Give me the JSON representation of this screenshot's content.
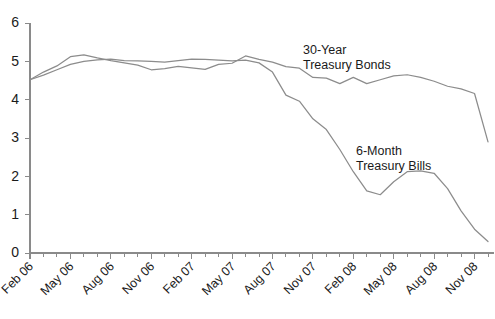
{
  "chart_data": {
    "type": "line",
    "title": "",
    "subtitle": "",
    "xlabel": "",
    "ylabel": "",
    "ylim": [
      0,
      6
    ],
    "y_ticks": [
      0,
      1,
      2,
      3,
      4,
      5,
      6
    ],
    "grid": false,
    "legend_position": "inline-annotation",
    "background_color": "#ffffff",
    "axis_color": "#8a8a8a",
    "x": [
      "Feb 06",
      "Mar 06",
      "Apr 06",
      "May 06",
      "Jun 06",
      "Jul 06",
      "Aug 06",
      "Sep 06",
      "Oct 06",
      "Nov 06",
      "Dec 06",
      "Jan 07",
      "Feb 07",
      "Mar 07",
      "Apr 07",
      "May 07",
      "Jun 07",
      "Jul 07",
      "Aug 07",
      "Sep 07",
      "Oct 07",
      "Nov 07",
      "Dec 07",
      "Jan 08",
      "Feb 08",
      "Mar 08",
      "Apr 08",
      "May 08",
      "Jun 08",
      "Jul 08",
      "Aug 08",
      "Sep 08",
      "Oct 08",
      "Nov 08",
      "Dec 08"
    ],
    "x_tick_labels": [
      {
        "index": 0,
        "label": "Feb 06"
      },
      {
        "index": 3,
        "label": "May 06"
      },
      {
        "index": 6,
        "label": "Aug 06"
      },
      {
        "index": 9,
        "label": "Nov 06"
      },
      {
        "index": 12,
        "label": "Feb 07"
      },
      {
        "index": 15,
        "label": "May 07"
      },
      {
        "index": 18,
        "label": "Aug 07"
      },
      {
        "index": 21,
        "label": "Nov 07"
      },
      {
        "index": 24,
        "label": "Feb 08"
      },
      {
        "index": 27,
        "label": "May 08"
      },
      {
        "index": 30,
        "label": "Aug 08"
      },
      {
        "index": 33,
        "label": "Nov 08"
      }
    ],
    "series": [
      {
        "name": "30-Year Treasury Bonds",
        "color": "#8c8c8c",
        "annotation_lines": [
          "30-Year",
          "Treasury Bonds"
        ],
        "values": [
          4.52,
          4.72,
          4.88,
          5.12,
          5.17,
          5.09,
          5.02,
          4.96,
          4.9,
          4.78,
          4.81,
          4.87,
          4.83,
          4.79,
          4.92,
          4.95,
          5.14,
          5.05,
          4.98,
          4.86,
          4.82,
          4.58,
          4.56,
          4.42,
          4.58,
          4.42,
          4.52,
          4.62,
          4.65,
          4.58,
          4.48,
          4.35,
          4.28,
          4.16,
          2.9
        ]
      },
      {
        "name": "6-Month Treasury Bills",
        "color": "#8c8c8c",
        "annotation_lines": [
          "6-Month",
          "Treasury Bills"
        ],
        "values": [
          4.52,
          4.64,
          4.78,
          4.92,
          5.0,
          5.04,
          5.06,
          5.02,
          5.01,
          5.0,
          4.98,
          5.02,
          5.06,
          5.05,
          5.03,
          5.01,
          5.03,
          4.96,
          4.72,
          4.12,
          3.96,
          3.5,
          3.22,
          2.7,
          2.12,
          1.62,
          1.52,
          1.86,
          2.12,
          2.14,
          2.08,
          1.68,
          1.1,
          0.62,
          0.3
        ]
      }
    ],
    "annotations": [
      {
        "series": "30-Year Treasury Bonds",
        "lines": [
          "30-Year",
          "Treasury Bonds"
        ],
        "x_px": 303,
        "y_px": 54
      },
      {
        "series": "6-Month Treasury Bills",
        "lines": [
          "6-Month",
          "Treasury Bills"
        ],
        "x_px": 356,
        "y_px": 155
      }
    ]
  }
}
